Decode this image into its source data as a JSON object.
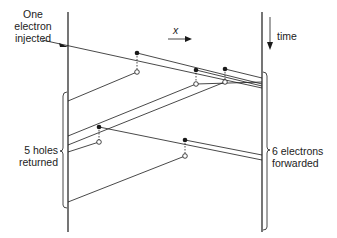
{
  "labels": {
    "injected": [
      "One",
      "electron",
      "injected"
    ],
    "x_axis": "x",
    "time_axis": "time",
    "holes": [
      "5 holes",
      "returned"
    ],
    "electrons": [
      "6 electrons",
      "forwarded"
    ]
  },
  "colors": {
    "ink": "#1a1a1a",
    "background": "#ffffff"
  },
  "geometry": {
    "left_wall_x": 68,
    "right_wall_x": 262,
    "ionization_events": [
      {
        "electron_dot": [
          137,
          53
        ],
        "hole_dot": [
          137,
          72
        ]
      },
      {
        "electron_dot": [
          196,
          70
        ],
        "hole_dot": [
          196,
          84
        ]
      },
      {
        "electron_dot": [
          225,
          69
        ],
        "hole_dot": [
          225,
          82
        ]
      },
      {
        "electron_dot": [
          99,
          127
        ],
        "hole_dot": [
          99,
          142
        ]
      },
      {
        "electron_dot": [
          185,
          140
        ],
        "hole_dot": [
          185,
          156
        ]
      }
    ]
  }
}
